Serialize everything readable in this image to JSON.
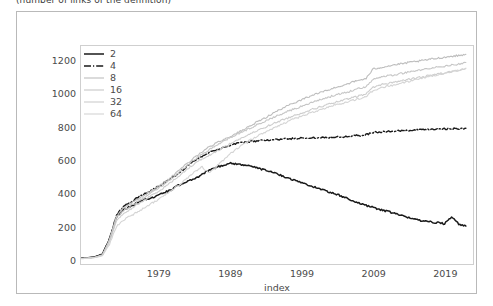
{
  "caption": {
    "text": "(number of links of the definition)"
  },
  "chart_data": {
    "type": "line",
    "title": "",
    "subtitle": "",
    "xlabel": "index",
    "ylabel": "",
    "xlim": [
      1968,
      2023
    ],
    "ylim": [
      -30,
      1290
    ],
    "xticks": [
      1979,
      1989,
      1999,
      2009,
      2019
    ],
    "yticks": [
      0,
      200,
      400,
      600,
      800,
      1000,
      1200
    ],
    "grid": false,
    "legend_position": "upper-left",
    "legend_title": "",
    "legend_entries": [
      "2",
      "4",
      "8",
      "16",
      "32",
      "64"
    ],
    "x": [
      1968,
      1969,
      1970,
      1971,
      1972,
      1973,
      1974,
      1975,
      1976,
      1977,
      1978,
      1979,
      1980,
      1981,
      1982,
      1983,
      1984,
      1985,
      1986,
      1987,
      1988,
      1989,
      1990,
      1991,
      1992,
      1993,
      1994,
      1995,
      1996,
      1997,
      1998,
      1999,
      2000,
      2001,
      2002,
      2003,
      2004,
      2005,
      2006,
      2007,
      2008,
      2009,
      2010,
      2011,
      2012,
      2013,
      2014,
      2015,
      2016,
      2017,
      2018,
      2019,
      2020,
      2021,
      2022
    ],
    "series": [
      {
        "name": "2",
        "color": "#1a1a1a",
        "linestyle": "solid",
        "linewidth": 1.5,
        "values": [
          5,
          8,
          14,
          30,
          120,
          255,
          300,
          320,
          345,
          360,
          372,
          390,
          408,
          430,
          452,
          470,
          490,
          512,
          540,
          556,
          568,
          582,
          575,
          568,
          560,
          548,
          536,
          522,
          508,
          492,
          476,
          462,
          448,
          432,
          418,
          404,
          390,
          372,
          356,
          340,
          324,
          312,
          300,
          288,
          276,
          262,
          250,
          240,
          232,
          226,
          220,
          214,
          252,
          212,
          200
        ]
      },
      {
        "name": "4",
        "color": "#1a1a1a",
        "linestyle": "dashdot",
        "linewidth": 1.4,
        "values": [
          4,
          7,
          13,
          28,
          122,
          268,
          318,
          345,
          372,
          398,
          420,
          442,
          470,
          500,
          530,
          566,
          598,
          622,
          648,
          662,
          676,
          690,
          700,
          706,
          712,
          716,
          720,
          722,
          725,
          728,
          730,
          732,
          733,
          735,
          736,
          738,
          740,
          742,
          745,
          748,
          752,
          768,
          770,
          772,
          774,
          776,
          778,
          780,
          782,
          784,
          786,
          788,
          790,
          786,
          792
        ]
      },
      {
        "name": "8",
        "color": "#bdbdbd",
        "linestyle": "solid",
        "linewidth": 1.1,
        "values": [
          4,
          7,
          12,
          26,
          118,
          262,
          310,
          336,
          362,
          390,
          418,
          444,
          474,
          508,
          544,
          582,
          618,
          650,
          680,
          702,
          724,
          744,
          766,
          788,
          812,
          836,
          860,
          884,
          906,
          928,
          948,
          966,
          984,
          1000,
          1014,
          1028,
          1042,
          1056,
          1070,
          1082,
          1094,
          1150,
          1160,
          1168,
          1176,
          1182,
          1190,
          1196,
          1202,
          1210,
          1216,
          1222,
          1228,
          1232,
          1240
        ]
      },
      {
        "name": "16",
        "color": "#c6c6c6",
        "linestyle": "solid",
        "linewidth": 1.1,
        "values": [
          3,
          6,
          11,
          24,
          112,
          250,
          296,
          322,
          350,
          378,
          406,
          432,
          462,
          496,
          532,
          570,
          604,
          636,
          664,
          690,
          714,
          736,
          758,
          778,
          798,
          818,
          838,
          858,
          876,
          894,
          910,
          926,
          942,
          956,
          970,
          984,
          996,
          1008,
          1020,
          1032,
          1044,
          1090,
          1100,
          1110,
          1116,
          1124,
          1132,
          1140,
          1148,
          1154,
          1162,
          1168,
          1176,
          1180,
          1190
        ]
      },
      {
        "name": "32",
        "color": "#cdcdcd",
        "linestyle": "solid",
        "linewidth": 1.1,
        "values": [
          3,
          5,
          10,
          22,
          104,
          232,
          278,
          304,
          332,
          360,
          388,
          414,
          444,
          478,
          512,
          548,
          580,
          608,
          628,
          652,
          676,
          700,
          722,
          742,
          762,
          782,
          802,
          820,
          838,
          854,
          870,
          886,
          900,
          914,
          928,
          940,
          952,
          964,
          976,
          988,
          1000,
          1042,
          1054,
          1064,
          1072,
          1080,
          1088,
          1096,
          1104,
          1112,
          1120,
          1128,
          1136,
          1142,
          1152
        ]
      },
      {
        "name": "64",
        "color": "#d4d4d4",
        "linestyle": "solid",
        "linewidth": 1.1,
        "values": [
          2,
          4,
          9,
          20,
          90,
          196,
          238,
          262,
          288,
          314,
          340,
          364,
          392,
          424,
          458,
          494,
          528,
          558,
          520,
          560,
          600,
          640,
          672,
          700,
          726,
          750,
          772,
          794,
          814,
          832,
          850,
          866,
          882,
          896,
          910,
          924,
          936,
          948,
          960,
          972,
          984,
          1020,
          1034,
          1046,
          1056,
          1066,
          1076,
          1086,
          1096,
          1106,
          1116,
          1126,
          1136,
          1144,
          1156
        ]
      }
    ]
  }
}
